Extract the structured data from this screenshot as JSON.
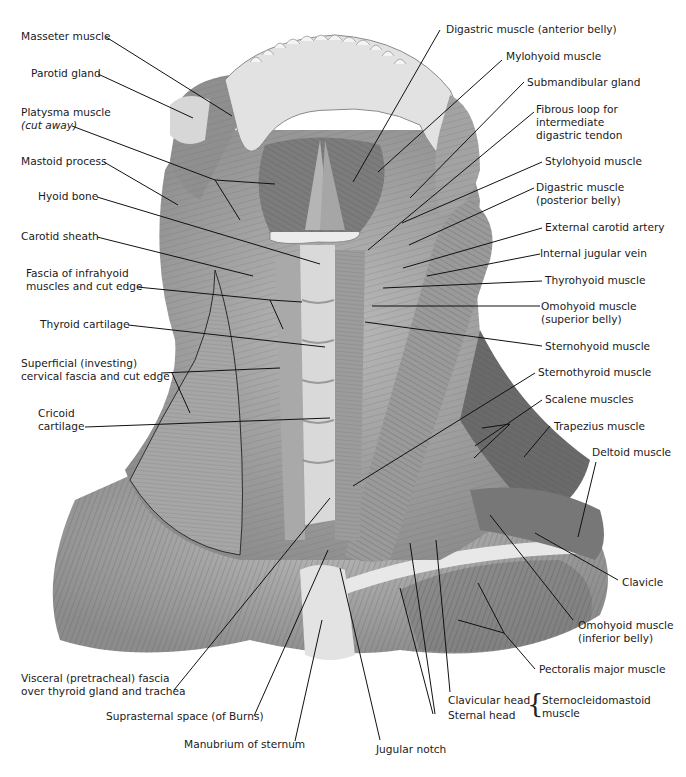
{
  "figure": {
    "illustration_style": "grayscale anatomical drawing",
    "colors": {
      "background": "#ffffff",
      "text": "#1a1a1a",
      "leader_line": "#111111",
      "muscle_dark": "#5e5e5e",
      "muscle_mid": "#8a8a8a",
      "muscle_light": "#bdbdbd",
      "bone": "#e6e6e6"
    }
  },
  "labels_left": [
    {
      "id": "masseter",
      "line1": "Masseter muscle"
    },
    {
      "id": "parotid",
      "line1": "Parotid gland"
    },
    {
      "id": "platysma",
      "line1": "Platysma muscle",
      "line2": "(cut away)"
    },
    {
      "id": "mastoid",
      "line1": "Mastoid process"
    },
    {
      "id": "hyoid",
      "line1": "Hyoid bone"
    },
    {
      "id": "carotid_sheath",
      "line1": "Carotid sheath"
    },
    {
      "id": "fascia_infrahyoid",
      "line1": "Fascia of infrahyoid",
      "line2": "muscles and cut edge"
    },
    {
      "id": "thyroid_cartilage",
      "line1": "Thyroid cartilage"
    },
    {
      "id": "superficial_fascia",
      "line1": "Superficial (investing)",
      "line2": "cervical fascia and cut edge"
    },
    {
      "id": "cricoid",
      "line1": "Cricoid",
      "line2": "cartilage"
    }
  ],
  "labels_right": [
    {
      "id": "digastric_ant",
      "line1": "Digastric muscle (anterior belly)"
    },
    {
      "id": "mylohyoid",
      "line1": "Mylohyoid muscle"
    },
    {
      "id": "submandibular",
      "line1": "Submandibular gland"
    },
    {
      "id": "fibrous_loop",
      "line1": "Fibrous loop for",
      "line2": "intermediate",
      "line3": "digastric tendon"
    },
    {
      "id": "stylohyoid",
      "line1": "Stylohyoid muscle"
    },
    {
      "id": "digastric_post",
      "line1": "Digastric muscle",
      "line2": "(posterior belly)"
    },
    {
      "id": "ext_carotid",
      "line1": "External carotid artery"
    },
    {
      "id": "int_jugular",
      "line1": "Internal jugular vein"
    },
    {
      "id": "thyrohyoid",
      "line1": "Thyrohyoid muscle"
    },
    {
      "id": "omohyoid_sup",
      "line1": "Omohyoid muscle",
      "line2": "(superior belly)"
    },
    {
      "id": "sternohyoid",
      "line1": "Sternohyoid muscle"
    },
    {
      "id": "sternothyroid",
      "line1": "Sternothyroid muscle"
    },
    {
      "id": "scalene",
      "line1": "Scalene muscles"
    },
    {
      "id": "trapezius",
      "line1": "Trapezius muscle"
    },
    {
      "id": "deltoid",
      "line1": "Deltoid muscle"
    },
    {
      "id": "clavicle",
      "line1": "Clavicle"
    },
    {
      "id": "omohyoid_inf",
      "line1": "Omohyoid muscle",
      "line2": "(inferior belly)"
    },
    {
      "id": "pectoralis",
      "line1": "Pectoralis major muscle"
    }
  ],
  "labels_bottom": [
    {
      "id": "visceral_fascia",
      "line1": "Visceral (pretracheal) fascia",
      "line2": "over thyroid gland and trachea"
    },
    {
      "id": "suprasternal",
      "line1": "Suprasternal space (of Burns)"
    },
    {
      "id": "manubrium",
      "line1": "Manubrium of sternum"
    },
    {
      "id": "jugular_notch",
      "line1": "Jugular notch"
    },
    {
      "id": "clavicular_head",
      "line1": "Clavicular head"
    },
    {
      "id": "sternal_head",
      "line1": "Sternal head"
    },
    {
      "id": "scm",
      "line1": "Sternocleidomastoid",
      "line2": "muscle"
    }
  ],
  "brace": {
    "symbol": "{",
    "groups": [
      "clavicular_head",
      "sternal_head"
    ],
    "target": "scm"
  }
}
